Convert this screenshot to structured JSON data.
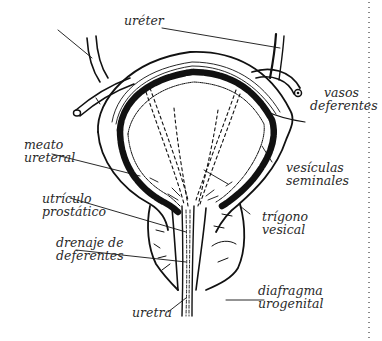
{
  "figure": {
    "colors": {
      "ink": "#111111",
      "text": "#2a2a2a",
      "background": "#ffffff",
      "margin_dots": "#8a8a8a"
    }
  },
  "labels": {
    "ureter": {
      "lines": [
        "uréter"
      ]
    },
    "vasos_deferentes": {
      "lines": [
        "vasos",
        "deferentes"
      ]
    },
    "meato_ureteral": {
      "lines": [
        "meato",
        "ureteral"
      ]
    },
    "vesiculas_seminales": {
      "lines": [
        "vesículas",
        "seminales"
      ]
    },
    "utriculo_prostatico": {
      "lines": [
        "utrículo",
        "prostático"
      ]
    },
    "trigono_vesical": {
      "lines": [
        "trígono",
        "vesical"
      ]
    },
    "drenaje_deferentes": {
      "lines": [
        "drenaje de",
        "deferentes"
      ]
    },
    "diafragma_urogenital": {
      "lines": [
        "diafragma",
        "urogenital"
      ]
    },
    "uretra": {
      "lines": [
        "uretra"
      ]
    }
  }
}
